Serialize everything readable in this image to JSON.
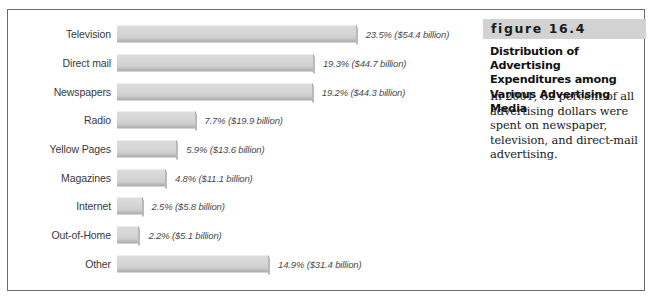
{
  "figure": {
    "number_label": "figure 16.4",
    "title": "Distribution of Advertising Expenditures among Various Advertising Media",
    "body": "In 2001, 62 percent of all advertising dollars were spent on newspaper, television, and direct-mail advertising."
  },
  "chart_data": {
    "type": "bar",
    "orientation": "horizontal",
    "title": "Distribution of Advertising Expenditures among Various Advertising Media",
    "xlabel": "",
    "ylabel": "",
    "grid": false,
    "legend": "none",
    "xlim": [
      0,
      25
    ],
    "unit": "percent of total advertising expenditures",
    "categories": [
      "Television",
      "Direct mail",
      "Newspapers",
      "Radio",
      "Yellow Pages",
      "Magazines",
      "Internet",
      "Out-of-Home",
      "Other"
    ],
    "values": [
      23.5,
      19.3,
      19.2,
      7.7,
      5.9,
      4.8,
      2.5,
      2.2,
      14.9
    ],
    "dollars_billion": [
      54.4,
      44.7,
      44.3,
      19.9,
      13.6,
      11.1,
      5.8,
      5.1,
      31.4
    ],
    "data_labels": [
      "23.5% ($54.4 billion)",
      "19.3% ($44.7 billion)",
      "19.2% ($44.3 billion)",
      "7.7% ($19.9 billion)",
      "5.9% ($13.6 billion)",
      "4.8% ($11.1 billion)",
      "2.5% ($5.8 billion)",
      "2.2% ($5.1 billion)",
      "14.9% ($31.4 billion)"
    ],
    "colors": {
      "bar_fill": "#d6d6d6",
      "bar_shadow": "#a9a9a9",
      "frame": "#6b6b6e",
      "caption_band": "#d2d2d2",
      "label_text": "#39393b"
    }
  },
  "rows": [
    {
      "label": "Television",
      "value": "23.5",
      "data_label": "23.5% ($54.4 billion)"
    },
    {
      "label": "Direct mail",
      "value": "19.3",
      "data_label": "19.3% ($44.7 billion)"
    },
    {
      "label": "Newspapers",
      "value": "19.2",
      "data_label": "19.2% ($44.3 billion)"
    },
    {
      "label": "Radio",
      "value": "7.7",
      "data_label": "7.7% ($19.9 billion)"
    },
    {
      "label": "Yellow Pages",
      "value": "5.9",
      "data_label": "5.9% ($13.6 billion)"
    },
    {
      "label": "Magazines",
      "value": "4.8",
      "data_label": "4.8% ($11.1 billion)"
    },
    {
      "label": "Internet",
      "value": "2.5",
      "data_label": "2.5% ($5.8 billion)"
    },
    {
      "label": "Out-of-Home",
      "value": "2.2",
      "data_label": "2.2% ($5.1 billion)"
    },
    {
      "label": "Other",
      "value": "14.9",
      "data_label": "14.9% ($31.4 billion)"
    }
  ]
}
